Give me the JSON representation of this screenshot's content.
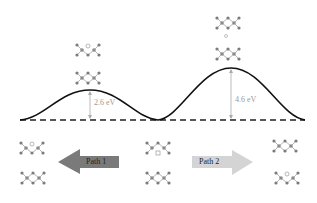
{
  "diagram": {
    "type": "energy-barrier-pathway",
    "barriers": [
      {
        "id": "barrier-1",
        "label": "2.6 eV",
        "value_eV": 2.6
      },
      {
        "id": "barrier-2",
        "label": "4.6 eV",
        "value_eV": 4.6
      }
    ],
    "paths": [
      {
        "id": "path-1",
        "label": "Path 1",
        "direction": "left",
        "color": "#7a7a7a"
      },
      {
        "id": "path-2",
        "label": "Path 2",
        "direction": "right",
        "color": "#d4d4d4"
      }
    ],
    "colors": {
      "curve": "#111111",
      "baseline": "#222222",
      "barrier_arrow": "#aaaaaa",
      "atom": "#7b7b7b",
      "bond": "#b5b5b5"
    }
  }
}
